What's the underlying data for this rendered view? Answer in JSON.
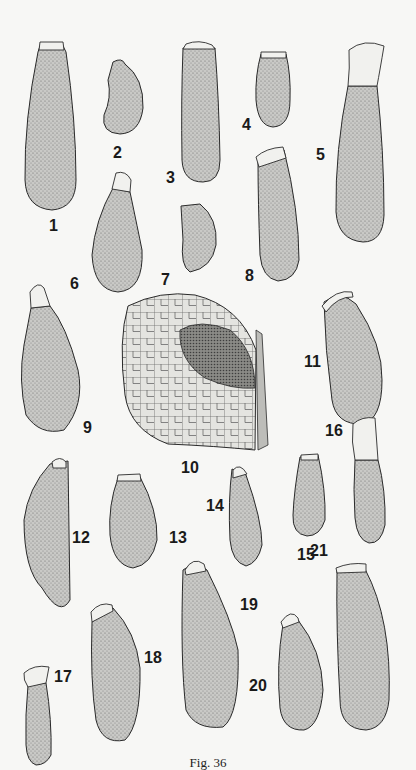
{
  "figure": {
    "caption": "Fig. 36",
    "background": "#f7f7f5",
    "stipple_color": "#6a6a6a",
    "outline_color": "#2a2a2a",
    "specimens": [
      {
        "id": "1",
        "label": "1",
        "label_pos": [
          49,
          218
        ],
        "path": "M40,46 L63,46 L66,52 Q76,120 76,180 Q76,208 52,210 Q26,208 25,180 Q24,120 38,52 Z",
        "cap": "M40,42 L63,42 L64,50 L39,50 Z"
      },
      {
        "id": "2",
        "label": "2",
        "label_pos": [
          113,
          145
        ],
        "path": "M113,62 Q122,57 125,64 Q144,78 143,108 Q140,133 120,134 Q101,133 104,115 Q112,98 108,80 Z",
        "cap": ""
      },
      {
        "id": "3",
        "label": "3",
        "label_pos": [
          166,
          170
        ],
        "path": "M183,48 L215,48 Q219,100 220,160 Q220,182 203,182 Q183,182 182,160 Q181,100 183,48 Z",
        "cap": "M186,44 Q199,39 212,45 L215,49 L183,49 Z"
      },
      {
        "id": "4",
        "label": "4",
        "label_pos": [
          242,
          117
        ],
        "path": "M261,54 L286,54 Q291,75 290,100 Q290,126 273,127 Q258,126 256,100 Q255,75 261,54 Z",
        "cap": "M261,52 L286,52 L286,58 L261,58 Z"
      },
      {
        "id": "5",
        "label": "5",
        "label_pos": [
          316,
          147
        ],
        "path": "M348,86 L377,86 Q384,150 384,215 Q383,242 363,242 Q338,240 336,212 Q335,150 348,86 Z",
        "cap": "M349,50 Q364,38 384,46 Q380,70 377,86 L348,86 Q350,68 349,50 Z"
      },
      {
        "id": "6",
        "label": "6",
        "label_pos": [
          70,
          276
        ],
        "path": "M113,188 L130,192 Q138,230 142,250 Q144,290 118,292 Q94,290 92,255 Q95,220 113,188 Z",
        "cap": "M116,173 Q126,170 131,180 L130,192 L112,189 Z"
      },
      {
        "id": "7",
        "label": "7",
        "label_pos": [
          161,
          272
        ],
        "path": "M181,206 L200,204 Q218,218 216,245 Q212,268 190,272 Q180,266 183,240 Z",
        "cap": ""
      },
      {
        "id": "8",
        "label": "8",
        "label_pos": [
          245,
          268
        ],
        "path": "M258,162 L284,150 Q299,210 299,260 Q296,280 278,281 Q262,278 260,255 Q258,200 258,162 Z",
        "cap": "M256,157 Q266,148 283,147 L286,158 L259,167 Z"
      },
      {
        "id": "9",
        "label": "9",
        "label_pos": [
          83,
          420
        ],
        "path": "M31,308 L50,306 Q66,325 78,370 Q85,405 64,430 Q40,436 26,415 Q18,380 24,345 Z",
        "cap": "M30,292 Q38,280 44,288 L50,306 L31,308 Z"
      },
      {
        "id": "10",
        "label": "10",
        "label_pos": [
          181,
          460
        ],
        "type": "cell-mass",
        "path": "M128,306 Q160,290 195,295 Q240,306 256,350 L255,450 Q215,446 168,444 Q130,430 125,395 Q118,340 128,306 Z",
        "inner": "M180,330 Q200,318 230,330 Q255,350 255,388 Q232,390 205,378 Q178,360 180,330 Z",
        "fin": "M256,330 L262,334 L268,445 L258,450 Z"
      },
      {
        "id": "11",
        "label": "11",
        "label_pos": [
          304,
          354
        ],
        "path": "M324,302 Q340,289 356,304 Q383,345 382,380 Q382,420 362,424 Q336,425 332,400 Q325,350 324,302 Z",
        "cap": "M322,306 Q336,289 352,292 L353,297 Q338,296 326,312 Z"
      },
      {
        "id": "12",
        "label": "12",
        "label_pos": [
          72,
          530
        ],
        "path": "M50,464 L68,461 L70,600 Q60,618 42,588 Q24,570 24,520 Q28,488 50,464 Z",
        "cap": "M52,462 Q60,455 66,462 L66,468 L53,468 Z"
      },
      {
        "id": "13",
        "label": "13",
        "label_pos": [
          169,
          530
        ],
        "path": "M118,478 L140,477 Q158,510 157,540 Q152,565 133,568 Q113,565 110,535 Q108,505 118,478 Z",
        "cap": "M118,475 L140,474 L141,481 L117,481 Z"
      },
      {
        "id": "14",
        "label": "14",
        "label_pos": [
          206,
          498
        ],
        "path": "M232,469 L246,475 Q262,520 262,545 Q258,563 246,566 Q232,562 230,540 Q228,500 232,469 Z",
        "cap": "M233,470 Q240,462 247,474 L233,478 Z"
      },
      {
        "id": "15",
        "label": "15",
        "label_pos": [
          297,
          547
        ],
        "path": "M300,457 L318,455 Q326,490 325,520 Q320,536 307,536 Q292,534 293,515 Q294,490 300,457 Z",
        "cap": "M301,455 L318,454 L318,460 L301,460 Z"
      },
      {
        "id": "16",
        "label": "16",
        "label_pos": [
          325,
          423
        ],
        "path": "M355,460 L378,460 Q386,490 385,525 Q381,544 369,543 Q357,540 355,518 Q353,490 355,460 Z",
        "cap": "M353,424 Q362,416 375,418 L378,460 L355,460 Q351,442 353,424 Z"
      },
      {
        "id": "17",
        "label": "17",
        "label_pos": [
          54,
          669
        ],
        "path": "M28,685 L46,683 Q52,720 51,755 Q46,765 36,765 Q27,762 26,745 Q25,715 28,685 Z",
        "cap": "M24,673 Q34,664 49,667 L46,683 L28,687 Q23,680 24,673 Z"
      },
      {
        "id": "18",
        "label": "18",
        "label_pos": [
          144,
          650
        ],
        "path": "M92,622 L113,608 Q136,632 140,668 Q141,725 125,740 Q102,745 96,720 Q90,680 92,622 Z",
        "cap": "M91,612 Q100,601 112,605 L113,611 L92,622 Z"
      },
      {
        "id": "19",
        "label": "19",
        "label_pos": [
          240,
          597
        ],
        "path": "M183,570 Q195,560 207,570 Q232,620 238,650 Q240,715 223,727 Q195,730 186,710 Q180,660 183,570 Z",
        "cap": "M185,570 Q193,556 204,564 L206,571 L186,575 Z"
      },
      {
        "id": "20",
        "label": "20",
        "label_pos": [
          249,
          678
        ],
        "path": "M283,624 L298,620 Q322,650 323,690 Q320,726 304,730 Q283,731 280,708 Q276,665 283,624 Z",
        "cap": "M281,622 Q291,608 298,618 L299,622 L283,628 Z"
      },
      {
        "id": "21",
        "label": "21",
        "label_pos": [
          310,
          543
        ],
        "path": "M337,571 L365,569 Q392,620 389,700 Q386,728 366,730 Q340,729 340,700 Q336,630 337,571 Z",
        "cap": "M336,568 Q350,562 366,564 L366,572 L337,573 Z"
      }
    ]
  }
}
